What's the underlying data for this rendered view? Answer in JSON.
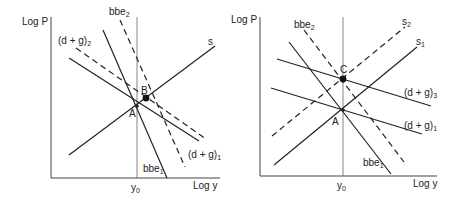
{
  "panels": [
    {
      "id": "left",
      "y_axis_label": "Log P",
      "x_axis_label": "Log y",
      "x_tick_label": "y",
      "x_tick_sub": "0",
      "points": [
        {
          "name": "A",
          "filled": false
        },
        {
          "name": "B",
          "filled": true
        }
      ],
      "curves": [
        {
          "name": "s",
          "base": "s",
          "sub": "",
          "style": "solid"
        },
        {
          "name": "(d+g)1",
          "base": "(d + g)",
          "sub": "1",
          "style": "solid"
        },
        {
          "name": "(d+g)2",
          "base": "(d + g)",
          "sub": "2",
          "style": "dashed"
        },
        {
          "name": "bbe1",
          "base": "bbe",
          "sub": "1",
          "style": "solid"
        },
        {
          "name": "bbe2",
          "base": "bbe",
          "sub": "2",
          "style": "dashed"
        }
      ]
    },
    {
      "id": "right",
      "y_axis_label": "Log P",
      "x_axis_label": "Log y",
      "x_tick_label": "y",
      "x_tick_sub": "0",
      "points": [
        {
          "name": "A",
          "filled": false
        },
        {
          "name": "C",
          "filled": true
        }
      ],
      "curves": [
        {
          "name": "s1",
          "base": "s",
          "sub": "1",
          "style": "solid"
        },
        {
          "name": "s2",
          "base": "s",
          "sub": "2",
          "style": "dashed"
        },
        {
          "name": "(d+g)1",
          "base": "(d + g)",
          "sub": "1",
          "style": "solid"
        },
        {
          "name": "(d+g)3",
          "base": "(d + g)",
          "sub": "3",
          "style": "solid"
        },
        {
          "name": "bbe1",
          "base": "bbe",
          "sub": "1",
          "style": "solid"
        },
        {
          "name": "bbe2",
          "base": "bbe",
          "sub": "2",
          "style": "dashed"
        }
      ]
    }
  ]
}
